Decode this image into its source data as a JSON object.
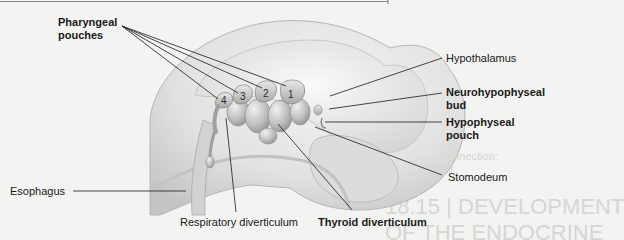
{
  "labels": {
    "pharyngeal_pouches": [
      "Pharyngeal",
      "pouches"
    ],
    "hypothalamus": "Hypothalamus",
    "neurohypophyseal_bud": [
      "Neurohypophyseal",
      "bud"
    ],
    "hypophyseal_pouch": [
      "Hypophyseal",
      "pouch"
    ],
    "stomodeum": "Stomodeum",
    "esophagus": "Esophagus",
    "respiratory_diverticulum": "Respiratory diverticulum",
    "thyroid_diverticulum": "Thyroid diverticulum"
  },
  "pouch_numbers": [
    "4",
    "3",
    "2",
    "1"
  ],
  "background_ghost_text": {
    "heading_line1": "18.15 | DEVELOPMENT",
    "heading_line2": "OF THE ENDOCRINE",
    "clinical_ref_line1": "See Clinical Connection:",
    "clinical_ref_line2": "Stress Disorder"
  },
  "colors": {
    "background": "#f3f3f2",
    "tissue_light": "#e4e4e3",
    "tissue_mid": "#c9c9c8",
    "tissue_dark": "#9d9d9c",
    "leader_line": "#1a1a1a"
  }
}
